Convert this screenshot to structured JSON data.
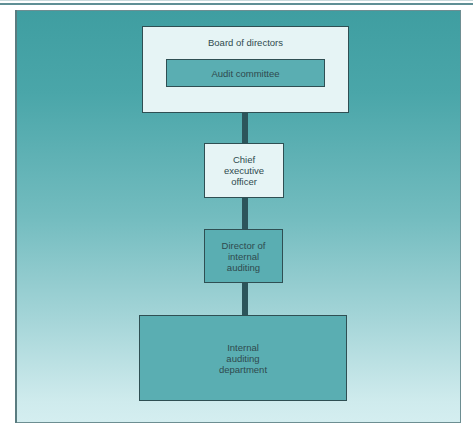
{
  "diagram": {
    "type": "org-chart",
    "colors": {
      "frame_gradient_top": "#3f9ea1",
      "frame_gradient_bottom": "#d4eef0",
      "light_box": "#e6f4f5",
      "teal_box": "#5aaeb2",
      "connector": "#2c555b",
      "text": "#2f4a4e"
    },
    "nodes": [
      {
        "id": "board",
        "label": "Board of directors",
        "style": "light"
      },
      {
        "id": "audit",
        "label": "Audit committee",
        "style": "teal",
        "parent_container": "board"
      },
      {
        "id": "ceo",
        "label": "Chief\nexecutive\nofficer",
        "style": "light"
      },
      {
        "id": "director",
        "label": "Director of\ninternal\nauditing",
        "style": "teal"
      },
      {
        "id": "dept",
        "label": "Internal\nauditing\ndepartment",
        "style": "teal"
      }
    ],
    "edges": [
      {
        "from": "board",
        "to": "ceo"
      },
      {
        "from": "ceo",
        "to": "director"
      },
      {
        "from": "director",
        "to": "dept"
      }
    ]
  }
}
